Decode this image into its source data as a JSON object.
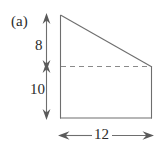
{
  "figure": {
    "panel_label": "(a)",
    "shape_name": "right-trapezoid",
    "stroke_color": "#6e6e6e",
    "dash_color": "#8a8a8a",
    "text_color": "#2b2b2b",
    "background_color": "#ffffff"
  },
  "dimensions": {
    "left_upper": "8",
    "left_lower": "10",
    "bottom": "12"
  },
  "geometry": {
    "top_left": [
      60,
      15
    ],
    "top_right": [
      152,
      67
    ],
    "bottom_right": [
      152,
      118
    ],
    "bottom_left": [
      60,
      118
    ],
    "dashed_line_y": 67,
    "vertical_dim_x": 46,
    "horizontal_dim_y": 135
  }
}
